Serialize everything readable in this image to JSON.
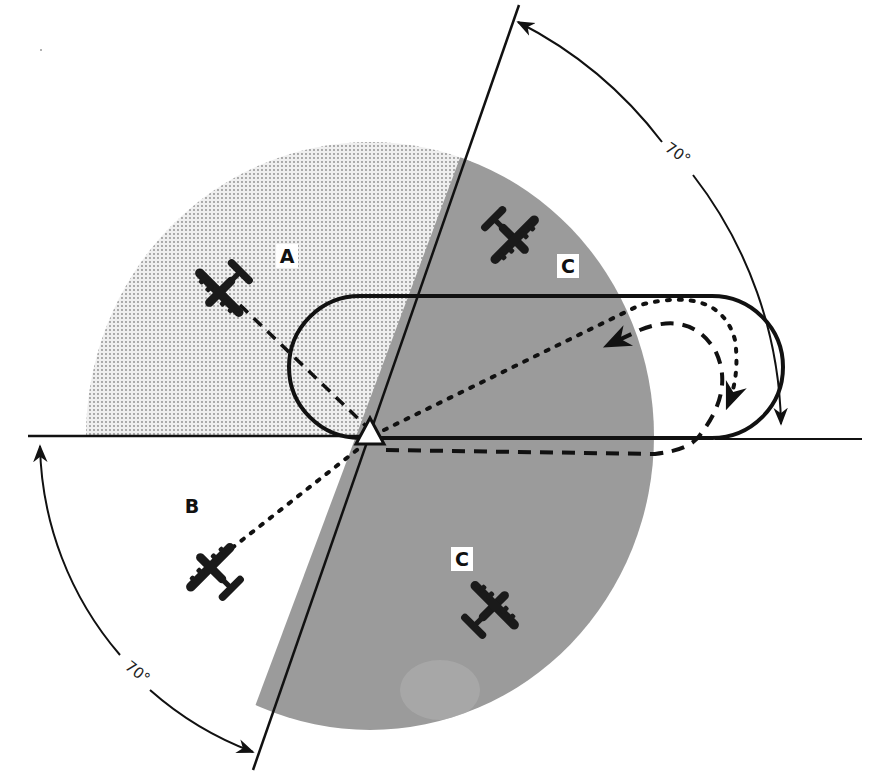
{
  "figure": {
    "sectors": [
      {
        "id": "A",
        "label": "A",
        "fill": "#e6e6e6",
        "pattern": "dotted"
      },
      {
        "id": "B",
        "label": "B",
        "fill": "#ffffff",
        "pattern": "none"
      },
      {
        "id": "C",
        "label": "C",
        "fill": "#9a9a9a",
        "pattern": "solid"
      }
    ],
    "labels": {
      "sector_a": "A",
      "sector_b": "B",
      "sector_c_upper": "C",
      "sector_c_lower": "C",
      "angle_upper": "70°",
      "angle_lower": "70°"
    },
    "colors": {
      "line": "#111111",
      "sector_a_bg": "#ececec",
      "sector_a_dot": "#8a8a8a",
      "sector_c": "#9b9b9b",
      "background": "#ffffff"
    },
    "station": {
      "icon": "triangle-station-icon",
      "x": 370,
      "y": 436
    },
    "aircraft": [
      {
        "id": "aircraft-a",
        "sector": "A"
      },
      {
        "id": "aircraft-b",
        "sector": "B"
      },
      {
        "id": "aircraft-c-upper",
        "sector": "C"
      },
      {
        "id": "aircraft-c-lower",
        "sector": "C"
      }
    ]
  }
}
